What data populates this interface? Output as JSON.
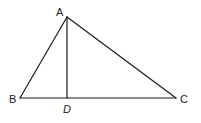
{
  "diagram": {
    "type": "triangle-with-altitude",
    "stroke_color": "#1a1a1a",
    "background": "#ffffff",
    "points": {
      "A": {
        "label": "A",
        "x": 67,
        "y": 17
      },
      "B": {
        "label": "B",
        "x": 20,
        "y": 98
      },
      "C": {
        "label": "C",
        "x": 176,
        "y": 98
      },
      "D": {
        "label": "D",
        "x": 67,
        "y": 98
      }
    },
    "segments": [
      {
        "from": "A",
        "to": "B"
      },
      {
        "from": "A",
        "to": "C"
      },
      {
        "from": "B",
        "to": "C"
      },
      {
        "from": "A",
        "to": "D"
      }
    ],
    "labels": {
      "a": "A",
      "b": "B",
      "c": "C",
      "d": "D"
    }
  }
}
